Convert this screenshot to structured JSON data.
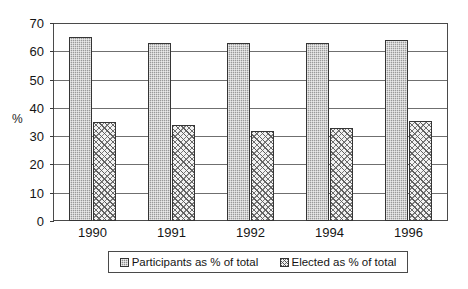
{
  "chart_data": {
    "type": "bar",
    "title": "",
    "xlabel": "",
    "ylabel": "%",
    "categories": [
      "1990",
      "1991",
      "1992",
      "1994",
      "1996"
    ],
    "series": [
      {
        "name": "Participants as % of total",
        "values": [
          65,
          63,
          63,
          63,
          64
        ]
      },
      {
        "name": "Elected as % of total",
        "values": [
          35,
          34,
          32,
          33,
          35.5
        ]
      }
    ],
    "ylim": [
      0,
      70
    ],
    "y_ticks": [
      0,
      10,
      20,
      30,
      40,
      50,
      60,
      70
    ],
    "grid": true,
    "legend_position": "bottom"
  },
  "legend": {
    "entries": [
      {
        "label": "Participants as % of total",
        "swatch": "series-0-swatch"
      },
      {
        "label": "Elected as % of total",
        "swatch": "series-1-swatch"
      }
    ]
  },
  "axis": {
    "y_title": "%",
    "y_tick_labels": [
      "70",
      "60",
      "50",
      "40",
      "30",
      "20",
      "10",
      "0"
    ],
    "x_tick_labels": [
      "1990",
      "1991",
      "1992",
      "1994",
      "1996"
    ]
  }
}
